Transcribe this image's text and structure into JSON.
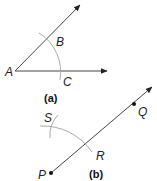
{
  "figure_a": {
    "caption": "(a)",
    "labels": {
      "vertex": "A",
      "upper_point": "B",
      "lower_point": "C"
    }
  },
  "figure_b": {
    "caption": "(b)",
    "labels": {
      "start": "P",
      "point_on_ray": "Q",
      "arc_point": "R",
      "arc_mark": "S"
    }
  },
  "colors": {
    "line": "#333333",
    "arc": "#aaaaaa",
    "text": "#222222"
  }
}
